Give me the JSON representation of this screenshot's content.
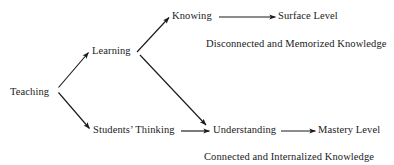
{
  "diagram": {
    "title_text": "",
    "nodes": [
      {
        "id": "teaching",
        "label": "Teaching"
      },
      {
        "id": "learning",
        "label": "Learning"
      },
      {
        "id": "students-thinking",
        "label": "Students’ Thinking"
      },
      {
        "id": "knowing",
        "label": "Knowing"
      },
      {
        "id": "understanding",
        "label": "Understanding"
      },
      {
        "id": "surface-level",
        "label": "Surface Level"
      },
      {
        "id": "mastery-level",
        "label": "Mastery Level"
      }
    ],
    "captions": [
      {
        "id": "surface-caption",
        "label": "Disconnected and Memorized Knowledge"
      },
      {
        "id": "mastery-caption",
        "label": "Connected and Internalized Knowledge"
      }
    ],
    "edges": [
      {
        "id": "teaching-to-learning",
        "from": "Teaching",
        "to": "Learning",
        "style": "arrow"
      },
      {
        "id": "teaching-to-students-thinking",
        "from": "Teaching",
        "to": "Students’ Thinking",
        "style": "arrow"
      },
      {
        "id": "learning-to-knowing",
        "from": "Learning",
        "to": "Knowing",
        "style": "arrow"
      },
      {
        "id": "learning-to-understanding",
        "from": "Learning",
        "to": "Understanding",
        "style": "arrow"
      },
      {
        "id": "knowing-to-surface-level",
        "from": "Knowing",
        "to": "Surface Level",
        "style": "arrow"
      },
      {
        "id": "students-thinking-to-understanding",
        "from": "Students’ Thinking",
        "to": "Understanding",
        "style": "arrow"
      },
      {
        "id": "understanding-to-mastery-level",
        "from": "Understanding",
        "to": "Mastery Level",
        "style": "arrow"
      }
    ],
    "colors": {
      "line": "#1a1a1a",
      "text": "#1a1a1a",
      "background": "#ffffff"
    }
  }
}
